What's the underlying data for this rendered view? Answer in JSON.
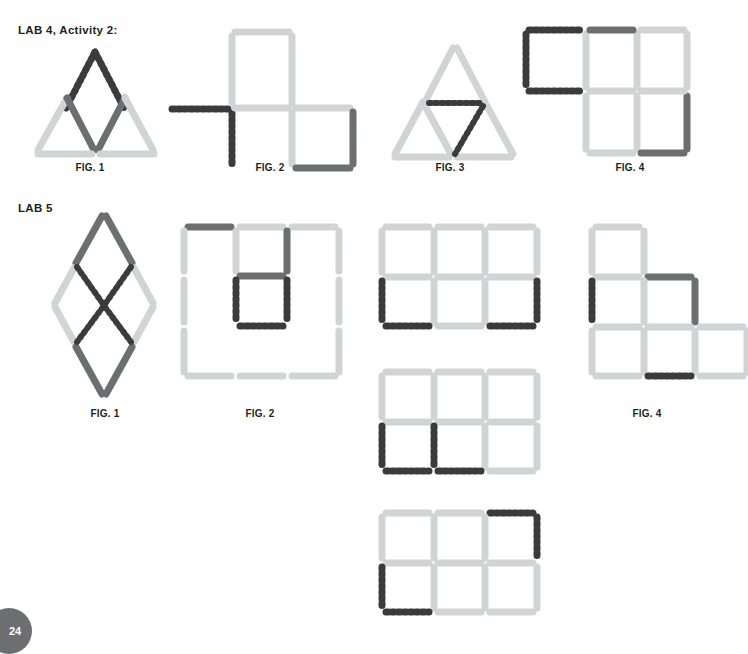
{
  "page": {
    "number": "24",
    "background": "#ffffff"
  },
  "colors": {
    "match_light": "#d2d3d4",
    "match_dark": "#6d6e71",
    "match_dashed_stroke": "#3b3b3b",
    "text": "#231f20",
    "badge_background": "#6d6e71"
  },
  "sections": [
    {
      "id": "lab4",
      "title": "LAB 4, Activity 2:",
      "figures": [
        {
          "label": "FIG. 1",
          "type": "triangles-pair-with-dashed-peak"
        },
        {
          "label": "FIG. 2",
          "type": "two-squares-diagonal-with-dashed-L"
        },
        {
          "label": "FIG. 3",
          "type": "big-triangle-with-dashed-inner"
        },
        {
          "label": "FIG. 4",
          "type": "two-by-two-grid-with-dashed-square"
        }
      ]
    },
    {
      "id": "lab5",
      "title": "LAB 5",
      "figures": [
        {
          "label": "FIG. 1",
          "type": "double-diamond-with-dashed-x"
        },
        {
          "label": "FIG. 2",
          "type": "big-square-with-dashed-inner-cell"
        },
        {
          "label": "FIG. 3a",
          "type": "three-by-two-grid-dashed-bottom-corners"
        },
        {
          "label": "FIG. 3b",
          "type": "three-by-two-grid-dashed-left-cells"
        },
        {
          "label": "FIG. 3c",
          "type": "three-by-two-grid-dashed-corner-swap"
        },
        {
          "label": "FIG. 4",
          "type": "staircase-grid-with-dark-and-dashed"
        }
      ]
    }
  ],
  "labels": {
    "lab4": {
      "fig1": "FIG. 1",
      "fig2": "FIG. 2",
      "fig3": "FIG. 3",
      "fig4": "FIG. 4"
    },
    "lab5": {
      "fig1": "FIG. 1",
      "fig2": "FIG. 2",
      "fig4": "FIG. 4"
    }
  }
}
